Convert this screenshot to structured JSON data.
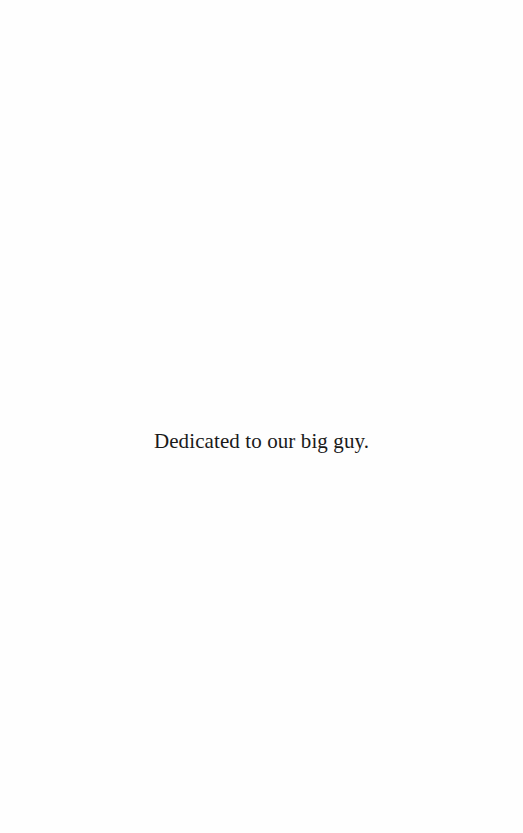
{
  "page": {
    "dedication": "Dedicated to our big guy."
  },
  "colors": {
    "background": "#fefefe",
    "text": "#1a1a1a"
  }
}
